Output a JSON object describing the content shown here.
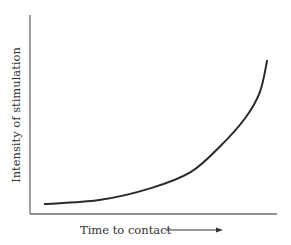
{
  "chart_data": {
    "type": "line",
    "title": "",
    "xlabel": "Time to contact",
    "ylabel": "Intensity of stimulation",
    "x_direction_arrow": true,
    "ticks": false,
    "grid": false,
    "legend": null,
    "xlim": [
      0,
      1
    ],
    "ylim": [
      0,
      1
    ],
    "series": [
      {
        "name": "intensity",
        "x": [
          0.06,
          0.28,
          0.49,
          0.65,
          0.77,
          0.87,
          0.93,
          0.96
        ],
        "y": [
          0.05,
          0.07,
          0.13,
          0.21,
          0.34,
          0.48,
          0.61,
          0.77
        ]
      }
    ],
    "colors": {
      "curve": "#2a2a2a",
      "axes": "#6b6b6b",
      "text": "#333333"
    }
  },
  "labels": {
    "x_axis": "Time to contact",
    "y_axis": "Intensity of stimulation"
  }
}
